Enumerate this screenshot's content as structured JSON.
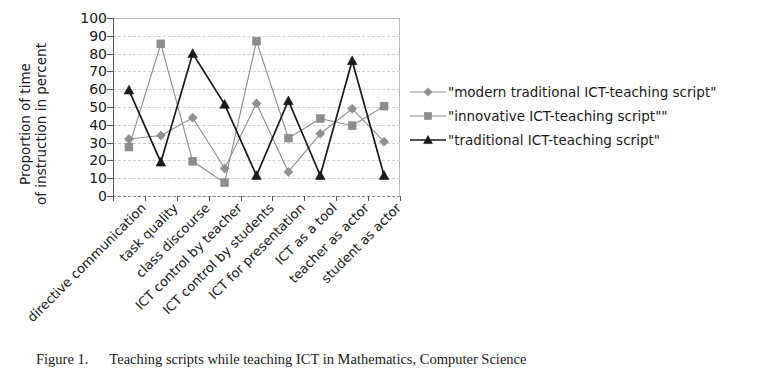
{
  "chart_data": {
    "type": "line",
    "title": "",
    "xlabel": "",
    "ylabel_line1": "Proportion of time",
    "ylabel_line2": "of instruction in percent",
    "ylim": [
      0,
      100
    ],
    "ytick_step": 10,
    "yticks": [
      100,
      90,
      80,
      70,
      60,
      50,
      40,
      30,
      20,
      10,
      0
    ],
    "grid": true,
    "legend_position": "right",
    "categories": [
      "directive communication",
      "task quality",
      "class discourse",
      "ICT control by teacher",
      "ICT control by students",
      "ICT for presentation",
      "ICT as a tool",
      "teacher as actor",
      "student as actor"
    ],
    "series": [
      {
        "name": "\"modern traditional ICT-teaching script\"",
        "marker": "diamond",
        "color": "#909090",
        "values": [
          32,
          34,
          44,
          15.5,
          52,
          13.5,
          35,
          49,
          30.5
        ]
      },
      {
        "name": "\"innovative ICT-teaching script\"\"",
        "marker": "square",
        "color": "#8c8c8c",
        "values": [
          27.5,
          85.5,
          19.5,
          7.5,
          87,
          32.5,
          43.5,
          39.5,
          50.5
        ]
      },
      {
        "name": "\"traditional ICT-teaching script\"",
        "marker": "triangle",
        "color": "#1a1a1a",
        "values": [
          59.5,
          19,
          80,
          51.5,
          11.5,
          53.5,
          11.5,
          76,
          11.5
        ]
      }
    ]
  },
  "caption": {
    "label": "Figure 1.",
    "text": "Teaching scripts while teaching ICT in Mathematics, Computer Science"
  }
}
